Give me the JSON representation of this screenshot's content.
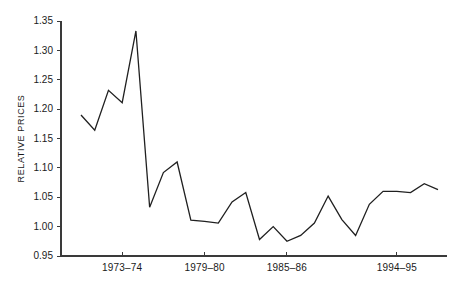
{
  "chart_data": {
    "type": "line",
    "title": "",
    "subtitle": "",
    "xlabel": "",
    "ylabel": "RELATIVE PRICES",
    "ylim": [
      0.95,
      1.35
    ],
    "ytick_values": [
      0.95,
      1.0,
      1.05,
      1.1,
      1.15,
      1.2,
      1.25,
      1.3,
      1.35
    ],
    "ytick_labels": [
      "0.95",
      "1.00",
      "1.05",
      "1.10",
      "1.15",
      "1.20",
      "1.25",
      "1.30",
      "1.35"
    ],
    "xtick_labels": [
      "1973–74",
      "1979–80",
      "1985–86",
      "1994–95"
    ],
    "xtick_indices": [
      3,
      9,
      15,
      23
    ],
    "grid": false,
    "legend": null,
    "series": [
      {
        "name": "Relative prices",
        "values": [
          1.19,
          1.164,
          1.232,
          1.211,
          1.333,
          1.033,
          1.092,
          1.11,
          1.011,
          1.009,
          1.006,
          1.042,
          1.058,
          0.978,
          1.0,
          0.975,
          0.985,
          1.006,
          1.052,
          1.012,
          0.985,
          1.038,
          1.06,
          1.06,
          1.058,
          1.073,
          1.063
        ]
      }
    ],
    "x_indices": [
      0,
      1,
      2,
      3,
      4,
      5,
      6,
      7,
      8,
      9,
      10,
      11,
      12,
      13,
      14,
      15,
      16,
      17,
      18,
      19,
      20,
      21,
      22,
      23,
      24,
      25,
      26
    ],
    "n_points": 27,
    "line_color": "#202020",
    "axis_color": "#3a3a3a",
    "background_color": "#ffffff"
  },
  "plot_geometry": {
    "left": 61,
    "right": 447,
    "top": 21,
    "bottom": 256,
    "x_first": 81,
    "x_last": 438
  }
}
